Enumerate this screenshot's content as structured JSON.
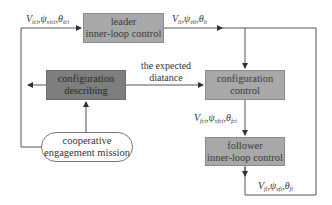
{
  "diagram": {
    "nodes": {
      "leader": {
        "line1": "leader",
        "line2": "inner-loop control"
      },
      "config_describing": {
        "line1": "configuration",
        "line2": "describing"
      },
      "config_control": {
        "line1": "configuration",
        "line2": "control"
      },
      "mission": {
        "line1": "cooperative",
        "line2": "engagement mission"
      },
      "follower": {
        "line1": "follower",
        "line2": "inner-loop control"
      }
    },
    "edge_labels": {
      "leader_cmd": {
        "v": "V",
        "v_sub": "lci",
        "psi": "ψ",
        "psi_sub": "vlci",
        "theta": "θ",
        "theta_sub": "lci"
      },
      "leader_out": {
        "v": "V",
        "v_sub": "li",
        "psi": "ψ",
        "psi_sub": "vli",
        "theta": "θ",
        "theta_sub": "li"
      },
      "expected": {
        "line1": "the expected",
        "line2": "diatance"
      },
      "follower_cmd": {
        "v": "V",
        "v_sub": "fci",
        "psi": "ψ",
        "psi_sub": "vfci",
        "theta": "θ",
        "theta_sub": "fci"
      },
      "follower_out": {
        "v": "V",
        "v_sub": "fi",
        "psi": "ψ",
        "psi_sub": "vfi",
        "theta": "θ",
        "theta_sub": "fi"
      }
    },
    "colors": {
      "box_light": "#a8a8a8",
      "box_dark": "#7e7e7e",
      "line": "#555555"
    }
  }
}
